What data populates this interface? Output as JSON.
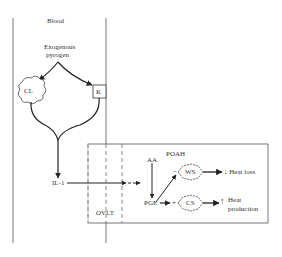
{
  "diagram": {
    "compartment": "Blood",
    "source": [
      "Exogenous",
      "pyrogen"
    ],
    "cells": {
      "cl": "CL",
      "k": "K"
    },
    "mediator": "IL-1",
    "organ": "OVLT",
    "region": "POAH",
    "aa": "AA",
    "pge": "PGE",
    "ws": "WS",
    "cs": "CS",
    "ws_sign": "−",
    "cs_sign": "+",
    "heat_loss": "↓ Heat loss",
    "heat_prod": [
      "Heat",
      "production"
    ],
    "up_arrow": "↑"
  }
}
